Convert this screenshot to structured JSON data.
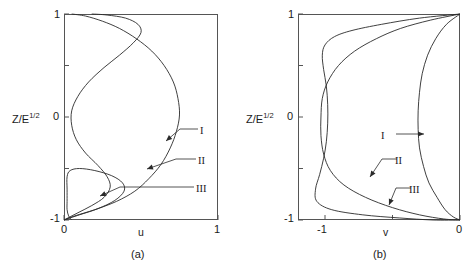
{
  "figure": {
    "background": "#ffffff",
    "stroke_color": "#2a2a2a",
    "axis_color": "#555555"
  },
  "panel_a": {
    "caption": "(a)",
    "xlabel": "u",
    "ylabel_main": "Z/E",
    "ylabel_exp": "1/2",
    "xticklabels": [
      "0",
      "1"
    ],
    "yticklabels": [
      "1",
      "0",
      "-1"
    ],
    "curve_labels": [
      "I",
      "II",
      "III"
    ]
  },
  "panel_b": {
    "caption": "(b)",
    "xlabel": "v",
    "ylabel_main": "Z/E",
    "ylabel_exp": "1/2",
    "xticklabels": [
      "-1",
      "0"
    ],
    "yticklabels": [
      "1",
      "0",
      "-1"
    ],
    "curve_labels": [
      "I",
      "II",
      "III"
    ]
  },
  "chart_data": {
    "type": "line",
    "title": "",
    "panels": [
      {
        "id": "a",
        "caption": "(a)",
        "xlabel": "u",
        "ylabel": "Z/E^1/2",
        "xlim": [
          0,
          1
        ],
        "ylim": [
          -1,
          1
        ],
        "xticks": [
          0,
          1
        ],
        "yticks": [
          1,
          0.5,
          0,
          -0.5,
          -1
        ],
        "ytick_labels": [
          "1",
          "",
          "0",
          "",
          "-1"
        ],
        "grid": false,
        "legend_position": "inline-annotations",
        "series": [
          {
            "name": "I",
            "label_anchor": [
              0.72,
              -0.18
            ],
            "points": [
              [
                0.0,
                -1.0
              ],
              [
                0.07,
                -0.96
              ],
              [
                0.2,
                -0.9
              ],
              [
                0.34,
                -0.82
              ],
              [
                0.46,
                -0.72
              ],
              [
                0.55,
                -0.6
              ],
              [
                0.63,
                -0.46
              ],
              [
                0.69,
                -0.3
              ],
              [
                0.73,
                -0.14
              ],
              [
                0.75,
                0.02
              ],
              [
                0.74,
                0.18
              ],
              [
                0.71,
                0.34
              ],
              [
                0.65,
                0.5
              ],
              [
                0.57,
                0.64
              ],
              [
                0.47,
                0.76
              ],
              [
                0.36,
                0.86
              ],
              [
                0.25,
                0.93
              ],
              [
                0.14,
                0.98
              ],
              [
                0.05,
                1.0
              ]
            ]
          },
          {
            "name": "II",
            "label_anchor": [
              0.38,
              -0.44
            ],
            "points": [
              [
                0.0,
                -1.0
              ],
              [
                0.09,
                -0.93
              ],
              [
                0.18,
                -0.86
              ],
              [
                0.26,
                -0.78
              ],
              [
                0.3,
                -0.68
              ],
              [
                0.28,
                -0.58
              ],
              [
                0.22,
                -0.47
              ],
              [
                0.14,
                -0.35
              ],
              [
                0.08,
                -0.22
              ],
              [
                0.05,
                -0.08
              ],
              [
                0.05,
                0.06
              ],
              [
                0.09,
                0.2
              ],
              [
                0.16,
                0.34
              ],
              [
                0.26,
                0.48
              ],
              [
                0.36,
                0.6
              ],
              [
                0.45,
                0.72
              ],
              [
                0.5,
                0.82
              ],
              [
                0.48,
                0.9
              ],
              [
                0.4,
                0.96
              ],
              [
                0.28,
                0.99
              ],
              [
                0.18,
                1.0
              ]
            ]
          },
          {
            "name": "III",
            "label_anchor": [
              0.17,
              -0.64
            ],
            "points": [
              [
                0.0,
                -1.0
              ],
              [
                0.1,
                -0.95
              ],
              [
                0.22,
                -0.89
              ],
              [
                0.33,
                -0.81
              ],
              [
                0.39,
                -0.72
              ],
              [
                0.38,
                -0.64
              ],
              [
                0.31,
                -0.57
              ],
              [
                0.2,
                -0.52
              ],
              [
                0.1,
                -0.5
              ],
              [
                0.04,
                -0.52
              ],
              [
                0.02,
                -0.58
              ],
              [
                0.02,
                -0.7
              ],
              [
                0.02,
                -0.82
              ],
              [
                0.02,
                -0.9
              ],
              [
                0.03,
                -0.96
              ],
              [
                0.05,
                -1.0
              ]
            ]
          }
        ],
        "note": "Three oscillatory Ekman-type u-velocity profiles; all collapse toward u=0 at Z/E^1/2 = -1 and emerge at the top boundary."
      },
      {
        "id": "b",
        "caption": "(b)",
        "xlabel": "v",
        "ylabel": "Z/E^1/2",
        "xlim": [
          -1.2,
          0
        ],
        "ylim": [
          -1,
          1
        ],
        "xticks": [
          -1,
          -0.5,
          0
        ],
        "xtick_labels": [
          "-1",
          "",
          "0"
        ],
        "yticks": [
          1,
          0.5,
          0,
          -0.5,
          -1
        ],
        "ytick_labels": [
          "1",
          "",
          "0",
          "",
          "-1"
        ],
        "grid": false,
        "legend_position": "inline-annotations",
        "series": [
          {
            "name": "I",
            "label_anchor": [
              -0.34,
              -0.2
            ],
            "points": [
              [
                0.0,
                1.0
              ],
              [
                -0.1,
                0.9
              ],
              [
                -0.18,
                0.76
              ],
              [
                -0.24,
                0.6
              ],
              [
                -0.28,
                0.42
              ],
              [
                -0.3,
                0.24
              ],
              [
                -0.31,
                0.06
              ],
              [
                -0.31,
                -0.12
              ],
              [
                -0.3,
                -0.3
              ],
              [
                -0.27,
                -0.48
              ],
              [
                -0.23,
                -0.64
              ],
              [
                -0.17,
                -0.78
              ],
              [
                -0.11,
                -0.9
              ],
              [
                -0.05,
                -0.97
              ],
              [
                0.0,
                -1.0
              ]
            ]
          },
          {
            "name": "II",
            "label_anchor": [
              -0.58,
              -0.56
            ],
            "points": [
              [
                0.0,
                1.0
              ],
              [
                -0.22,
                0.94
              ],
              [
                -0.44,
                0.86
              ],
              [
                -0.62,
                0.76
              ],
              [
                -0.78,
                0.64
              ],
              [
                -0.9,
                0.5
              ],
              [
                -0.98,
                0.34
              ],
              [
                -1.02,
                0.18
              ],
              [
                -1.03,
                0.0
              ],
              [
                -1.03,
                -0.18
              ],
              [
                -1.01,
                -0.36
              ],
              [
                -0.96,
                -0.52
              ],
              [
                -0.86,
                -0.66
              ],
              [
                -0.7,
                -0.78
              ],
              [
                -0.5,
                -0.88
              ],
              [
                -0.3,
                -0.95
              ],
              [
                -0.12,
                -0.99
              ],
              [
                0.0,
                -1.0
              ]
            ]
          },
          {
            "name": "III",
            "label_anchor": [
              -0.42,
              -0.8
            ],
            "points": [
              [
                0.0,
                1.0
              ],
              [
                -0.3,
                0.96
              ],
              [
                -0.58,
                0.9
              ],
              [
                -0.8,
                0.84
              ],
              [
                -0.93,
                0.78
              ],
              [
                -1.0,
                0.7
              ],
              [
                -1.02,
                0.6
              ],
              [
                -1.01,
                0.46
              ],
              [
                -0.99,
                0.3
              ],
              [
                -0.98,
                0.12
              ],
              [
                -0.98,
                -0.06
              ],
              [
                -0.99,
                -0.24
              ],
              [
                -1.01,
                -0.4
              ],
              [
                -1.04,
                -0.56
              ],
              [
                -1.07,
                -0.7
              ],
              [
                -1.06,
                -0.82
              ],
              [
                -0.95,
                -0.9
              ],
              [
                -0.72,
                -0.95
              ],
              [
                -0.45,
                -0.98
              ],
              [
                -0.2,
                -1.0
              ],
              [
                0.0,
                -1.0
              ]
            ]
          }
        ],
        "note": "Three v-velocity profiles; all converge to v=0 at both Z/E^1/2 = 1 and -1, with curves II and III reaching v ≈ -1."
      }
    ]
  }
}
